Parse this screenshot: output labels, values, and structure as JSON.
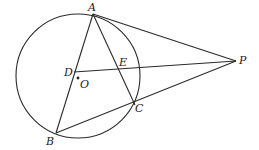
{
  "diagram": {
    "type": "geometry",
    "circle": {
      "center_label": "O",
      "cx": 78,
      "cy": 76,
      "r": 62
    },
    "points": {
      "A": {
        "label": "A",
        "x": 93,
        "y": 14
      },
      "B": {
        "label": "B",
        "x": 56,
        "y": 133
      },
      "C": {
        "label": "C",
        "x": 135,
        "y": 105
      },
      "D": {
        "label": "D",
        "x": 74,
        "y": 72
      },
      "E": {
        "label": "E",
        "x": 119,
        "y": 68
      },
      "O": {
        "label": "O",
        "x": 78,
        "y": 78
      },
      "P": {
        "label": "P",
        "x": 236,
        "y": 61
      }
    },
    "segments": [
      "AB",
      "AC",
      "BC",
      "AP",
      "BP",
      "DP"
    ],
    "colors": {
      "stroke": "#2a2a2a",
      "background": "#ffffff"
    }
  }
}
